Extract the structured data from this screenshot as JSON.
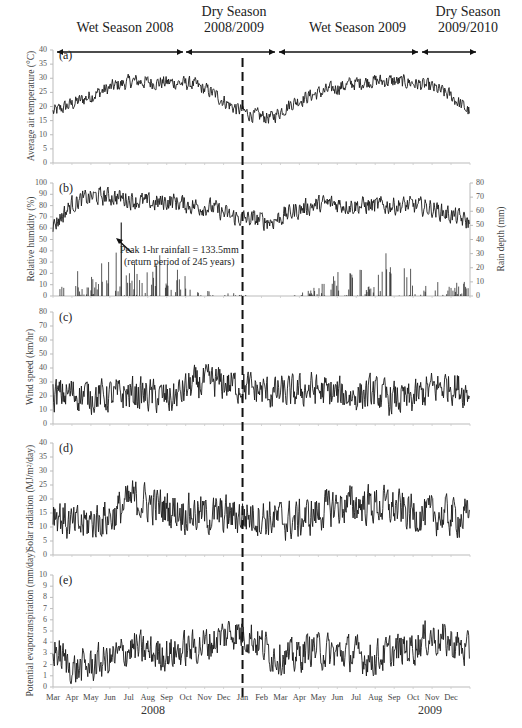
{
  "figure": {
    "seasons": [
      {
        "label_line1": "Wet Season 2008",
        "label_line2": "",
        "x0": 57,
        "x1": 183
      },
      {
        "label_line1": "Dry Season",
        "label_line2": "2008/2009",
        "x0": 186,
        "x1": 275
      },
      {
        "label_line1": "Wet Season 2009",
        "label_line2": "",
        "x0": 279,
        "x1": 418
      },
      {
        "label_line1": "Dry Season",
        "label_line2": "2009/2010",
        "x0": 422,
        "x1": 476
      }
    ],
    "year_labels": [
      "2008",
      "2009"
    ],
    "months": [
      "Mar",
      "Apr",
      "May",
      "Jun",
      "Jul",
      "Aug",
      "Sep",
      "Oct",
      "Nov",
      "Dec",
      "Jan",
      "Feb",
      "Mar",
      "Apr",
      "May",
      "Jun",
      "Jul",
      "Aug",
      "Sep",
      "Oct",
      "Nov",
      "Dec"
    ],
    "annotation": {
      "line1": "Peak 1-hr rainfall = 133.5mm",
      "line2": "(return period of 245 years)"
    },
    "divider": "dashed line at start of Jan 2009"
  },
  "chart_data": [
    {
      "panel": "(a)",
      "type": "line",
      "title": "",
      "xlabel": "Month (Mar 2008 - Dec 2009)",
      "ylabel": "Average air temperature (°C)",
      "ylim": [
        0,
        40
      ],
      "yticks": [
        0,
        5,
        10,
        15,
        20,
        25,
        30,
        35,
        40
      ],
      "categories": [
        "Mar",
        "Apr",
        "May",
        "Jun",
        "Jul",
        "Aug",
        "Sep",
        "Oct",
        "Nov",
        "Dec",
        "Jan",
        "Feb",
        "Mar",
        "Apr",
        "May",
        "Jun",
        "Jul",
        "Aug",
        "Sep",
        "Oct",
        "Nov",
        "Dec"
      ],
      "series": [
        {
          "name": "Average air temperature",
          "values": [
            18,
            21,
            24,
            27,
            29,
            28.5,
            28.5,
            28,
            25,
            20,
            17,
            16,
            21,
            24,
            26,
            28,
            29,
            29,
            28.5,
            27,
            24,
            18
          ]
        }
      ],
      "noise": 2.5
    },
    {
      "panel": "(b)",
      "type": "line+bar",
      "ylabel": "Relative humidity (%)",
      "ylabel_right": "Rain depth (mm)",
      "ylim": [
        0,
        100
      ],
      "ylim_right": [
        0,
        80
      ],
      "yticks": [
        0,
        10,
        20,
        30,
        40,
        50,
        60,
        70,
        80,
        90,
        100
      ],
      "yticks_right": [
        0,
        10,
        20,
        30,
        40,
        50,
        60,
        70,
        80
      ],
      "categories": [
        "Mar",
        "Apr",
        "May",
        "Jun",
        "Jul",
        "Aug",
        "Sep",
        "Oct",
        "Nov",
        "Dec",
        "Jan",
        "Feb",
        "Mar",
        "Apr",
        "May",
        "Jun",
        "Jul",
        "Aug",
        "Sep",
        "Oct",
        "Nov",
        "Dec"
      ],
      "series": [
        {
          "name": "Relative humidity",
          "axis": "left",
          "values": [
            62,
            82,
            88,
            88,
            85,
            82,
            84,
            80,
            78,
            70,
            68,
            66,
            74,
            80,
            82,
            80,
            80,
            80,
            80,
            78,
            72,
            65
          ]
        },
        {
          "name": "Rain depth (daily peaks)",
          "axis": "right",
          "type": "bar",
          "values": [
            0,
            22,
            12,
            43,
            20,
            25,
            18,
            8,
            2,
            2,
            0,
            0,
            0,
            4,
            13,
            18,
            11,
            27,
            15,
            12,
            8,
            8
          ]
        }
      ],
      "noise": 8,
      "annotation": "Peak 1-hr rainfall = 133.5mm (return period of 245 years)"
    },
    {
      "panel": "(c)",
      "type": "line",
      "ylabel": "Wind speed (km/hr)",
      "ylim": [
        0,
        80
      ],
      "yticks": [
        0,
        10,
        20,
        30,
        40,
        50,
        60,
        70,
        80
      ],
      "categories": [
        "Mar",
        "Apr",
        "May",
        "Jun",
        "Jul",
        "Aug",
        "Sep",
        "Oct",
        "Nov",
        "Dec",
        "Jan",
        "Feb",
        "Mar",
        "Apr",
        "May",
        "Jun",
        "Jul",
        "Aug",
        "Sep",
        "Oct",
        "Nov",
        "Dec"
      ],
      "series": [
        {
          "name": "Wind speed",
          "values": [
            20,
            22,
            20,
            20,
            22,
            20,
            18,
            28,
            30,
            28,
            25,
            22,
            22,
            25,
            22,
            20,
            22,
            18,
            17,
            25,
            28,
            22
          ]
        }
      ],
      "noise": 12
    },
    {
      "panel": "(d)",
      "type": "line",
      "ylabel": "Solar radiation (MJ/m²/day)",
      "ylim": [
        0,
        40
      ],
      "yticks": [
        0,
        5,
        10,
        15,
        20,
        25,
        30,
        35,
        40
      ],
      "categories": [
        "Mar",
        "Apr",
        "May",
        "Jun",
        "Jul",
        "Aug",
        "Sep",
        "Oct",
        "Nov",
        "Dec",
        "Jan",
        "Feb",
        "Mar",
        "Apr",
        "May",
        "Jun",
        "Jul",
        "Aug",
        "Sep",
        "Oct",
        "Nov",
        "Dec"
      ],
      "series": [
        {
          "name": "Solar radiation",
          "values": [
            16,
            10,
            12,
            14,
            20,
            18,
            16,
            15,
            14,
            14,
            14,
            13,
            12,
            14,
            17,
            18,
            18,
            17,
            15,
            14,
            14,
            13
          ]
        }
      ],
      "noise": 7
    },
    {
      "panel": "(e)",
      "type": "line",
      "ylabel": "Potential evapotranspiration (mm/day)",
      "ylim": [
        0,
        10
      ],
      "yticks": [
        0,
        1,
        2,
        3,
        4,
        5,
        6,
        7,
        8,
        9,
        10
      ],
      "categories": [
        "Mar",
        "Apr",
        "May",
        "Jun",
        "Jul",
        "Aug",
        "Sep",
        "Oct",
        "Nov",
        "Dec",
        "Jan",
        "Feb",
        "Mar",
        "Apr",
        "May",
        "Jun",
        "Jul",
        "Aug",
        "Sep",
        "Oct",
        "Nov",
        "Dec"
      ],
      "series": [
        {
          "name": "Potential evapotranspiration",
          "values": [
            3.5,
            1.5,
            2,
            2.5,
            3.5,
            3,
            3,
            3.5,
            4,
            5,
            4.5,
            3,
            2.5,
            3.5,
            3,
            3,
            2.5,
            3,
            3.5,
            4.5,
            4,
            3
          ]
        }
      ],
      "noise": 1.6
    }
  ]
}
